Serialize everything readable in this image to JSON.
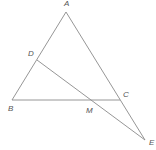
{
  "diagram": {
    "type": "geometry",
    "points": {
      "A": {
        "label": "A",
        "x": 66,
        "y": 12,
        "lx": 64,
        "ly": 6
      },
      "B": {
        "label": "B",
        "x": 12,
        "y": 100,
        "lx": 8,
        "ly": 111
      },
      "C": {
        "label": "C",
        "x": 120,
        "y": 100,
        "lx": 123,
        "ly": 97
      },
      "D": {
        "label": "D",
        "x": 37,
        "y": 60,
        "lx": 28,
        "ly": 56
      },
      "M": {
        "label": "M",
        "x": 91,
        "y": 100,
        "lx": 86,
        "ly": 113
      },
      "E": {
        "label": "E",
        "x": 145,
        "y": 140,
        "lx": 149,
        "ly": 145
      }
    },
    "segments": [
      [
        "A",
        "B"
      ],
      [
        "A",
        "E"
      ],
      [
        "B",
        "C"
      ],
      [
        "D",
        "E"
      ]
    ],
    "stroke_color": "#8a8a8a",
    "label_color": "#555555"
  }
}
